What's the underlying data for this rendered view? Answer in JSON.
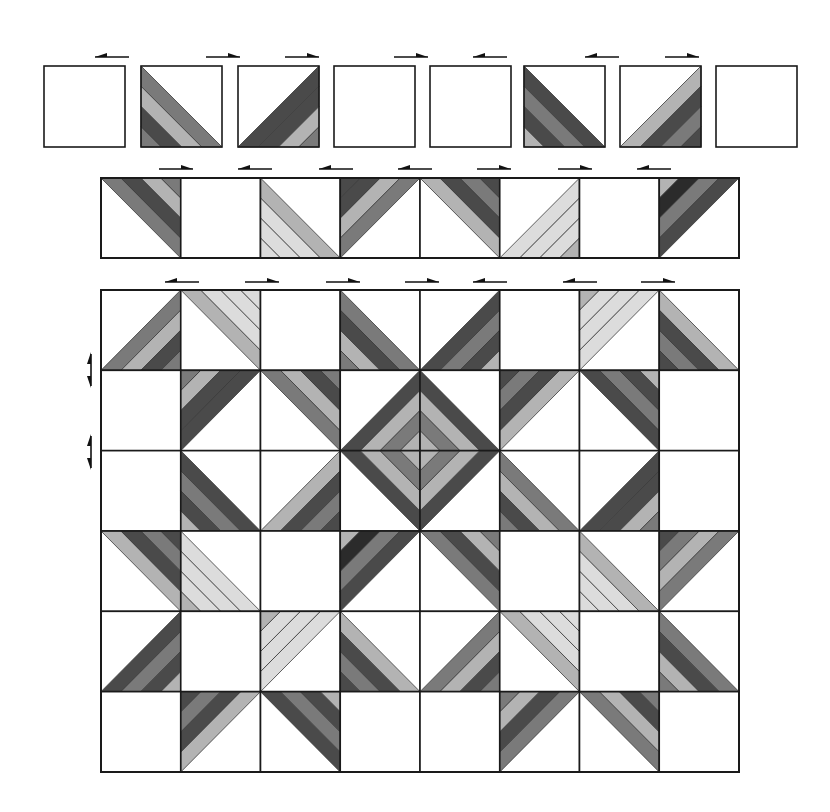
{
  "palette": {
    "black": "#2b2b2b",
    "dark": "#4a4a4a",
    "mid": "#7a7a7a",
    "light": "#b3b3b3",
    "pale": "#dcdcdc",
    "white": "#ffffff",
    "line": "#1a1a1a"
  },
  "legend_note": "Each cell: tri = corner filled by striped triangle (tl, tr, bl, br) or none; stripes listed from the diagonal outward to the corner.",
  "row1": {
    "label": "Step 1 - units",
    "x": [
      44,
      141,
      238,
      334,
      430,
      524,
      620,
      716
    ],
    "y": 66,
    "size": 81,
    "arrows": [
      {
        "x": 112,
        "dir": "left"
      },
      {
        "x": 223,
        "dir": "right"
      },
      {
        "x": 302,
        "dir": "right"
      },
      {
        "x": 411,
        "dir": "right"
      },
      {
        "x": 490,
        "dir": "left"
      },
      {
        "x": 602,
        "dir": "left"
      },
      {
        "x": 682,
        "dir": "right"
      }
    ],
    "cells": [
      {
        "tri": "none"
      },
      {
        "tri": "bl",
        "stripes": [
          "mid",
          "light",
          "dark",
          "mid"
        ]
      },
      {
        "tri": "br",
        "stripes": [
          "dark",
          "dark",
          "light",
          "mid"
        ]
      },
      {
        "tri": "none"
      },
      {
        "tri": "none"
      },
      {
        "tri": "bl",
        "stripes": [
          "dark",
          "mid",
          "dark",
          "light"
        ]
      },
      {
        "tri": "br",
        "stripes": [
          "light",
          "dark",
          "mid",
          "dark"
        ]
      },
      {
        "tri": "none"
      }
    ]
  },
  "row2": {
    "label": "Step 2 - joined row",
    "x0": 101,
    "y": 178,
    "width": 638,
    "height": 80,
    "cols": 8,
    "arrows": [
      {
        "x": 176,
        "dir": "right"
      },
      {
        "x": 255,
        "dir": "left"
      },
      {
        "x": 336,
        "dir": "left"
      },
      {
        "x": 415,
        "dir": "left"
      },
      {
        "x": 494,
        "dir": "right"
      },
      {
        "x": 575,
        "dir": "right"
      },
      {
        "x": 654,
        "dir": "left"
      }
    ],
    "cells": [
      {
        "tri": "tr",
        "stripes": [
          "mid",
          "dark",
          "light",
          "mid"
        ]
      },
      {
        "tri": "none"
      },
      {
        "tri": "bl",
        "stripes": [
          "light",
          "pale",
          "pale",
          "pale"
        ]
      },
      {
        "tri": "tl",
        "stripes": [
          "mid",
          "light",
          "dark",
          "dark"
        ]
      },
      {
        "tri": "tr",
        "stripes": [
          "light",
          "dark",
          "mid",
          "dark"
        ]
      },
      {
        "tri": "br",
        "stripes": [
          "pale",
          "pale",
          "pale",
          "light"
        ]
      },
      {
        "tri": "none"
      },
      {
        "tri": "tl",
        "stripes": [
          "dark",
          "mid",
          "black",
          "light"
        ]
      }
    ]
  },
  "grid": {
    "label": "Step 3 - assembled quilt",
    "x0": 101,
    "y0": 290,
    "width": 638,
    "height": 482,
    "cols": 8,
    "rows": 6,
    "top_arrows": [
      {
        "x": 182,
        "dir": "left"
      },
      {
        "x": 262,
        "dir": "right"
      },
      {
        "x": 343,
        "dir": "right"
      },
      {
        "x": 422,
        "dir": "right"
      },
      {
        "x": 490,
        "dir": "left"
      },
      {
        "x": 580,
        "dir": "left"
      },
      {
        "x": 658,
        "dir": "right"
      }
    ],
    "side_arrows": [
      {
        "y": 370,
        "label": "seam 1"
      },
      {
        "y": 452,
        "label": "seam 2"
      }
    ],
    "cells": [
      [
        {
          "tri": "br",
          "stripes": [
            "mid",
            "light",
            "dark",
            "mid"
          ]
        },
        {
          "tri": "tr",
          "stripes": [
            "light",
            "pale",
            "pale",
            "pale"
          ]
        },
        {
          "tri": "none"
        },
        {
          "tri": "bl",
          "stripes": [
            "mid",
            "dark",
            "light",
            "mid"
          ]
        },
        {
          "tri": "br",
          "stripes": [
            "dark",
            "mid",
            "dark",
            "light"
          ]
        },
        {
          "tri": "none"
        },
        {
          "tri": "tl",
          "stripes": [
            "pale",
            "pale",
            "pale",
            "light"
          ]
        },
        {
          "tri": "bl",
          "stripes": [
            "light",
            "dark",
            "mid",
            "dark"
          ]
        }
      ],
      [
        {
          "tri": "none"
        },
        {
          "tri": "tl",
          "stripes": [
            "dark",
            "dark",
            "light",
            "mid"
          ]
        },
        {
          "tri": "tr",
          "stripes": [
            "mid",
            "light",
            "dark",
            "mid"
          ]
        },
        {
          "tri": "br",
          "stripes": [
            "light",
            "mid",
            "light",
            "dark"
          ],
          "center": true
        },
        {
          "tri": "bl",
          "stripes": [
            "light",
            "mid",
            "light",
            "dark"
          ],
          "center": true
        },
        {
          "tri": "tl",
          "stripes": [
            "light",
            "dark",
            "mid",
            "dark"
          ]
        },
        {
          "tri": "tr",
          "stripes": [
            "dark",
            "mid",
            "dark",
            "light"
          ]
        },
        {
          "tri": "none"
        }
      ],
      [
        {
          "tri": "none"
        },
        {
          "tri": "bl",
          "stripes": [
            "dark",
            "mid",
            "dark",
            "light"
          ]
        },
        {
          "tri": "br",
          "stripes": [
            "light",
            "dark",
            "mid",
            "dark"
          ]
        },
        {
          "tri": "tr",
          "stripes": [
            "light",
            "mid",
            "light",
            "dark"
          ],
          "center": true
        },
        {
          "tri": "tl",
          "stripes": [
            "light",
            "mid",
            "light",
            "dark"
          ],
          "center": true
        },
        {
          "tri": "bl",
          "stripes": [
            "mid",
            "light",
            "dark",
            "mid"
          ]
        },
        {
          "tri": "br",
          "stripes": [
            "dark",
            "dark",
            "light",
            "mid"
          ]
        },
        {
          "tri": "none"
        }
      ],
      [
        {
          "tri": "tr",
          "stripes": [
            "light",
            "dark",
            "mid",
            "dark"
          ]
        },
        {
          "tri": "bl",
          "stripes": [
            "pale",
            "pale",
            "pale",
            "light"
          ]
        },
        {
          "tri": "none"
        },
        {
          "tri": "tl",
          "stripes": [
            "dark",
            "mid",
            "black",
            "light"
          ]
        },
        {
          "tri": "tr",
          "stripes": [
            "mid",
            "dark",
            "light",
            "mid"
          ]
        },
        {
          "tri": "none"
        },
        {
          "tri": "bl",
          "stripes": [
            "light",
            "pale",
            "pale",
            "pale"
          ]
        },
        {
          "tri": "tl",
          "stripes": [
            "mid",
            "light",
            "mid",
            "dark"
          ]
        }
      ],
      [
        {
          "tri": "br",
          "stripes": [
            "dark",
            "mid",
            "dark",
            "light"
          ]
        },
        {
          "tri": "none"
        },
        {
          "tri": "tl",
          "stripes": [
            "pale",
            "pale",
            "pale",
            "light"
          ]
        },
        {
          "tri": "bl",
          "stripes": [
            "light",
            "dark",
            "mid",
            "dark"
          ]
        },
        {
          "tri": "br",
          "stripes": [
            "mid",
            "light",
            "dark",
            "mid"
          ]
        },
        {
          "tri": "tr",
          "stripes": [
            "light",
            "pale",
            "pale",
            "pale"
          ]
        },
        {
          "tri": "none"
        },
        {
          "tri": "bl",
          "stripes": [
            "mid",
            "dark",
            "light",
            "mid"
          ]
        }
      ],
      [
        {
          "tri": "none"
        },
        {
          "tri": "tl",
          "stripes": [
            "light",
            "dark",
            "mid",
            "dark"
          ]
        },
        {
          "tri": "tr",
          "stripes": [
            "dark",
            "mid",
            "dark",
            "light"
          ]
        },
        {
          "tri": "none"
        },
        {
          "tri": "none"
        },
        {
          "tri": "tl",
          "stripes": [
            "mid",
            "dark",
            "light",
            "mid"
          ]
        },
        {
          "tri": "tr",
          "stripes": [
            "mid",
            "light",
            "dark",
            "mid"
          ]
        },
        {
          "tri": "none"
        }
      ]
    ]
  }
}
